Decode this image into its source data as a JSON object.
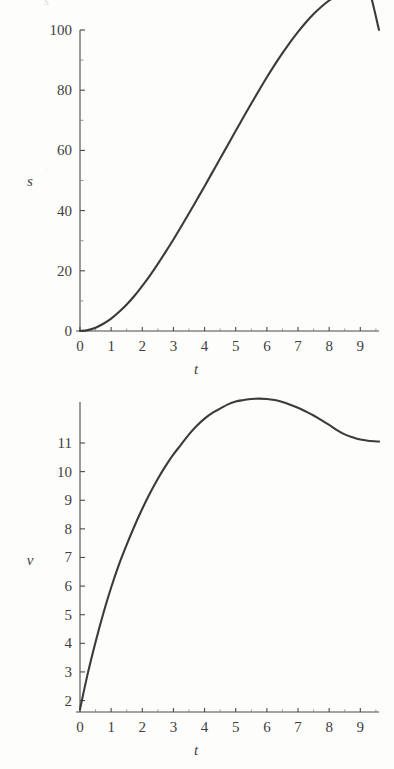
{
  "page": {
    "background_color": "#fdfdfc",
    "ink_color": "#3b3b3b",
    "partial_top_glyph": "s"
  },
  "figures": [
    {
      "id": "figure-s",
      "name": "displacement-plot",
      "y_axis_label": "s",
      "x_axis_label": "t"
    },
    {
      "id": "figure-v",
      "name": "velocity-plot",
      "y_axis_label": "v",
      "x_axis_label": "t"
    }
  ],
  "chart_data": [
    {
      "type": "line",
      "name": "displacement-vs-time",
      "title": "",
      "xlabel": "t",
      "ylabel": "s",
      "xlim": [
        0,
        9.6
      ],
      "ylim": [
        0,
        103
      ],
      "grid": false,
      "legend": null,
      "x_ticks": [
        0,
        1,
        2,
        3,
        4,
        5,
        6,
        7,
        8,
        9
      ],
      "x_tick_labels": [
        "0",
        "1",
        "2",
        "3",
        "4",
        "5",
        "6",
        "7",
        "8",
        "9"
      ],
      "y_ticks": [
        0,
        20,
        40,
        60,
        80,
        100
      ],
      "y_tick_labels": [
        "0",
        "20",
        "40",
        "60",
        "80",
        "100"
      ],
      "y_minor_ticks": [
        10,
        30,
        50,
        70,
        90
      ],
      "x_minor_ticks": [
        0.5,
        1.5,
        2.5,
        3.5,
        4.5,
        5.5,
        6.5,
        7.5,
        8.5,
        9.5
      ],
      "series": [
        {
          "name": "s(t)",
          "x": [
            0,
            0.25,
            0.5,
            0.75,
            1,
            1.25,
            1.5,
            1.75,
            2,
            2.25,
            2.5,
            2.75,
            3,
            3.25,
            3.5,
            3.75,
            4,
            4.25,
            4.5,
            4.75,
            5,
            5.25,
            5.5,
            5.75,
            6,
            6.25,
            6.5,
            6.75,
            7,
            7.25,
            7.5,
            7.75,
            8,
            8.25,
            8.5,
            8.75,
            9,
            9.25,
            9.6
          ],
          "y": [
            0,
            0.3,
            1.1,
            2.4,
            4.1,
            6.3,
            8.8,
            11.7,
            15.0,
            18.5,
            22.3,
            26.3,
            30.4,
            34.7,
            39.1,
            43.6,
            48.1,
            52.7,
            57.3,
            61.9,
            66.5,
            71.1,
            75.6,
            80.0,
            84.3,
            88.4,
            92.3,
            96.0,
            99.4,
            102.5,
            105.3,
            107.7,
            109.8,
            111.4,
            112.7,
            113.6,
            114.1,
            114.3,
            100.0
          ]
        }
      ]
    },
    {
      "type": "line",
      "name": "velocity-vs-time",
      "title": "",
      "xlabel": "t",
      "ylabel": "v",
      "xlim": [
        0,
        9.6
      ],
      "ylim": [
        1.6,
        12.8
      ],
      "grid": false,
      "legend": null,
      "x_ticks": [
        0,
        1,
        2,
        3,
        4,
        5,
        6,
        7,
        8,
        9
      ],
      "x_tick_labels": [
        "0",
        "1",
        "2",
        "3",
        "4",
        "5",
        "6",
        "7",
        "8",
        "9"
      ],
      "y_ticks": [
        2,
        3,
        4,
        5,
        6,
        7,
        8,
        9,
        10,
        11
      ],
      "y_tick_labels": [
        "2",
        "3",
        "4",
        "5",
        "6",
        "7",
        "8",
        "9",
        "10",
        "11"
      ],
      "x_minor_ticks": [
        0.5,
        1.5,
        2.5,
        3.5,
        4.5,
        5.5,
        6.5,
        7.5,
        8.5,
        9.5
      ],
      "peak": {
        "t": 5.75,
        "v": 12.55
      },
      "series": [
        {
          "name": "v(t)",
          "x": [
            0,
            0.25,
            0.5,
            0.75,
            1,
            1.25,
            1.5,
            1.75,
            2,
            2.25,
            2.5,
            2.75,
            3,
            3.25,
            3.5,
            3.75,
            4,
            4.25,
            4.5,
            4.75,
            5,
            5.25,
            5.5,
            5.75,
            6,
            6.25,
            6.5,
            6.75,
            7,
            7.25,
            7.5,
            7.75,
            8,
            8.25,
            8.5,
            8.75,
            9,
            9.25,
            9.6
          ],
          "y": [
            1.7,
            2.95,
            4.05,
            5.05,
            5.95,
            6.75,
            7.45,
            8.1,
            8.7,
            9.25,
            9.75,
            10.2,
            10.6,
            10.95,
            11.3,
            11.6,
            11.85,
            12.05,
            12.2,
            12.35,
            12.45,
            12.5,
            12.54,
            12.55,
            12.54,
            12.5,
            12.43,
            12.34,
            12.23,
            12.1,
            11.96,
            11.8,
            11.63,
            11.45,
            11.3,
            11.2,
            11.12,
            11.08,
            11.05
          ]
        }
      ]
    }
  ]
}
